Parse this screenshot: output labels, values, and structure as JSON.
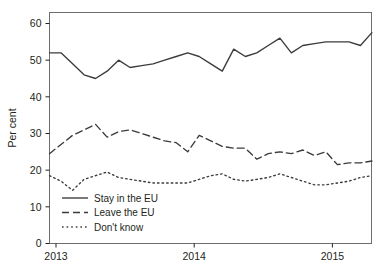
{
  "chart_data": {
    "type": "line",
    "title": "",
    "xlabel": "",
    "ylabel": "Per cent",
    "ylim": [
      0,
      63
    ],
    "xlim": [
      2013.0,
      2015.33
    ],
    "grid": false,
    "legend_position": "bottom-left",
    "x_tick_labels": [
      "2013",
      "2014",
      "2015"
    ],
    "x_tick_values": [
      2013,
      2014,
      2015
    ],
    "y_tick_labels": [
      "0",
      "10",
      "20",
      "30",
      "40",
      "50",
      "60"
    ],
    "y_tick_values": [
      0,
      10,
      20,
      30,
      40,
      50,
      60
    ],
    "x": [
      2013.0,
      2013.083,
      2013.167,
      2013.25,
      2013.333,
      2013.417,
      2013.5,
      2013.583,
      2013.667,
      2013.75,
      2013.833,
      2013.917,
      2014.0,
      2014.083,
      2014.167,
      2014.25,
      2014.333,
      2014.417,
      2014.5,
      2014.583,
      2014.667,
      2014.75,
      2014.833,
      2014.917,
      2015.0,
      2015.083,
      2015.167,
      2015.25,
      2015.333
    ],
    "series": [
      {
        "name": "Stay in the EU",
        "style": "solid",
        "color": "#3b3b3b",
        "values": [
          52,
          52,
          49,
          46,
          45,
          47,
          50,
          48,
          48.5,
          49,
          50,
          51,
          52,
          51,
          49,
          47,
          53,
          51,
          52,
          54,
          56,
          52,
          54,
          54.5,
          55,
          55,
          55,
          54,
          57.5
        ]
      },
      {
        "name": "Leave the EU",
        "style": "dashed",
        "color": "#3b3b3b",
        "values": [
          24.5,
          27,
          29.5,
          31,
          32.5,
          29,
          30.5,
          31,
          30,
          29,
          28,
          27.5,
          25,
          29.5,
          28,
          26.5,
          26,
          26,
          23,
          24.5,
          25,
          24.5,
          25.5,
          24,
          25,
          21.5,
          22,
          22,
          22.5
        ]
      },
      {
        "name": "Don't know",
        "style": "dotted",
        "color": "#3b3b3b",
        "values": [
          18.5,
          17,
          14.5,
          17.5,
          18.5,
          19.5,
          18,
          17.5,
          17,
          16.5,
          16.5,
          16.5,
          16.5,
          17.5,
          18.5,
          19,
          17.5,
          17,
          17.5,
          18,
          19,
          18,
          17,
          16,
          16,
          16.5,
          17,
          18,
          18.5
        ]
      }
    ],
    "legend": [
      {
        "label": "Stay in the EU",
        "style": "solid"
      },
      {
        "label": "Leave the EU",
        "style": "dashed"
      },
      {
        "label": "Don't know",
        "style": "dotted"
      }
    ]
  }
}
